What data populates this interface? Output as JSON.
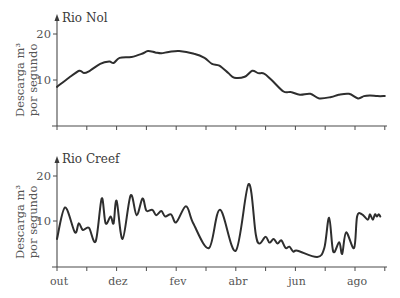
{
  "chart_data": [
    {
      "type": "line",
      "title": "Rio Nol",
      "xlabel": "",
      "ylabel": "Descarga m³ por segundo",
      "ylabel_lines": [
        "Descarga m³",
        "por segundo"
      ],
      "yticks": [
        10,
        20
      ],
      "ytick_labels": [
        "10",
        "20"
      ],
      "ylim": [
        0,
        23
      ],
      "xlim": [
        0,
        11
      ],
      "x_months": [
        "out",
        "nov",
        "dez",
        "jan",
        "fev",
        "mar",
        "abr",
        "mai",
        "jun",
        "jul",
        "ago",
        "set"
      ],
      "x_tick_labels": [],
      "grid": false,
      "legend": null,
      "series": [
        {
          "name": "Rio Nol",
          "x": [
            0,
            0.4,
            0.75,
            0.9,
            1.1,
            1.45,
            1.75,
            1.9,
            2.1,
            2.5,
            2.85,
            3.05,
            3.3,
            3.5,
            3.75,
            4.1,
            4.6,
            4.95,
            5.2,
            5.45,
            5.75,
            5.95,
            6.3,
            6.55,
            6.75,
            6.95,
            7.2,
            7.6,
            7.85,
            8.15,
            8.5,
            8.8,
            9.2,
            9.45,
            9.8,
            10.1,
            10.3,
            10.5,
            10.75,
            11.0
          ],
          "values": [
            8.5,
            10.5,
            12.0,
            11.5,
            12.0,
            13.5,
            14.0,
            13.7,
            14.8,
            15.0,
            15.7,
            16.3,
            16.0,
            15.8,
            16.1,
            16.3,
            15.7,
            14.8,
            13.5,
            13.1,
            11.5,
            10.5,
            10.7,
            12.0,
            11.5,
            11.4,
            10.0,
            7.5,
            7.4,
            6.8,
            7.0,
            6.0,
            6.3,
            6.8,
            7.0,
            6.0,
            6.5,
            6.6,
            6.5,
            6.5
          ]
        }
      ]
    },
    {
      "type": "line",
      "title": "Rio Creef",
      "xlabel": "",
      "ylabel": "Descarga m³ por segundo",
      "ylabel_lines": [
        "Descarga m³",
        "por segundo"
      ],
      "yticks": [
        10,
        20
      ],
      "ytick_labels": [
        "10",
        "20"
      ],
      "ylim": [
        0,
        23
      ],
      "xlim": [
        0,
        11
      ],
      "x_months": [
        "out",
        "nov",
        "dez",
        "jan",
        "fev",
        "mar",
        "abr",
        "mai",
        "jun",
        "jul",
        "ago",
        "set"
      ],
      "x_tick_labels": [
        "out",
        "dez",
        "fev",
        "abr",
        "jun",
        "ago"
      ],
      "x_tick_label_positions": [
        0,
        2,
        4,
        6,
        8,
        10
      ],
      "grid": false,
      "legend": null,
      "series": [
        {
          "name": "Rio Creef",
          "x": [
            0,
            0.27,
            0.6,
            0.73,
            0.87,
            1.07,
            1.3,
            1.5,
            1.63,
            1.8,
            1.9,
            2.0,
            2.2,
            2.47,
            2.67,
            2.87,
            3.0,
            3.2,
            3.33,
            3.5,
            3.63,
            3.83,
            4.0,
            4.33,
            4.57,
            5.1,
            5.47,
            6.0,
            6.43,
            6.67,
            6.8,
            7.0,
            7.13,
            7.27,
            7.4,
            7.53,
            7.67,
            7.8,
            7.93,
            8.07,
            8.73,
            8.97,
            9.13,
            9.27,
            9.47,
            9.57,
            9.7,
            9.97,
            10.07,
            10.23,
            10.43,
            10.5,
            10.6,
            10.67,
            10.73,
            10.8,
            10.85
          ],
          "values": [
            6.0,
            13.0,
            7.5,
            9.5,
            8.0,
            8.5,
            5.5,
            15.0,
            9.5,
            11.0,
            9.5,
            14.5,
            6.0,
            15.7,
            11.3,
            15.0,
            12.3,
            12.5,
            11.3,
            12.2,
            11.0,
            11.5,
            9.7,
            13.3,
            9.5,
            4.0,
            12.5,
            3.4,
            18.2,
            7.0,
            5.0,
            6.5,
            5.2,
            6.0,
            5.0,
            5.7,
            4.0,
            4.3,
            3.2,
            3.4,
            2.0,
            4.0,
            10.7,
            3.2,
            5.3,
            2.7,
            7.5,
            4.0,
            11.0,
            11.5,
            10.3,
            11.5,
            10.3,
            11.5,
            11.0,
            11.5,
            11.0
          ]
        }
      ]
    }
  ],
  "panels": [
    {
      "title": "Rio Nol",
      "ylabel_line1": "Descarga m³",
      "ylabel_line2": "por segundo",
      "ytick_20": "20",
      "ytick_10": "10"
    },
    {
      "title": "Rio Creef",
      "ylabel_line1": "Descarga m³",
      "ylabel_line2": "por segundo",
      "ytick_20": "20",
      "ytick_10": "10"
    }
  ],
  "xaxis": {
    "labels": [
      "out",
      "dez",
      "fev",
      "abr",
      "jun",
      "ago"
    ]
  },
  "colors": {
    "line": "#2e2e2e",
    "axis": "#4a4a4a",
    "text": "#555555"
  }
}
